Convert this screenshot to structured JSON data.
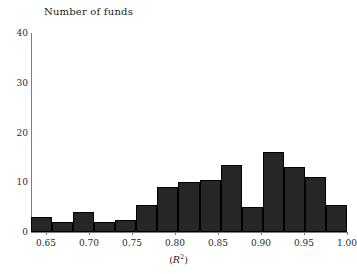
{
  "chart_data": {
    "type": "bar",
    "title": "Number of funds",
    "xlabel": "(R2)",
    "ylabel": "Number of funds",
    "xlim": [
      0.6325,
      1.0
    ],
    "ylim": [
      0,
      40
    ],
    "grid": false,
    "legend": "none",
    "bin_width": 0.0245,
    "x_ticks": [
      "0.65",
      "0.70",
      "0.75",
      "0.80",
      "0.85",
      "0.90",
      "0.95",
      "1.00"
    ],
    "x_tick_values": [
      0.65,
      0.7,
      0.75,
      0.8,
      0.85,
      0.9,
      0.95,
      1.0
    ],
    "y_ticks": [
      "0",
      "10",
      "20",
      "30",
      "40"
    ],
    "y_tick_values": [
      0,
      10,
      20,
      30,
      40
    ],
    "categories": [
      "0.633-0.657",
      "0.657-0.682",
      "0.682-0.706",
      "0.706-0.731",
      "0.731-0.755",
      "0.755-0.780",
      "0.780-0.804",
      "0.804-0.829",
      "0.829-0.853",
      "0.853-0.878",
      "0.878-0.902",
      "0.902-0.927",
      "0.927-0.951",
      "0.951-0.976",
      "0.976-1.000"
    ],
    "bin_left": [
      0.6325,
      0.657,
      0.6815,
      0.706,
      0.7305,
      0.755,
      0.7795,
      0.804,
      0.8285,
      0.853,
      0.8775,
      0.902,
      0.9265,
      0.951,
      0.9755
    ],
    "bin_right": [
      0.657,
      0.6815,
      0.706,
      0.7305,
      0.755,
      0.7795,
      0.804,
      0.8285,
      0.853,
      0.8775,
      0.902,
      0.9265,
      0.951,
      0.9755,
      1.0
    ],
    "values": [
      3,
      2,
      4,
      2,
      2.5,
      5.5,
      9,
      10,
      10.5,
      13.5,
      5,
      16,
      13,
      11,
      5.5
    ],
    "bar_color": "#262626"
  },
  "axis": {
    "title": "Number of funds",
    "x_title_prefix": "(",
    "x_title_var": "R",
    "x_title_exp": "2",
    "x_title_suffix": ")"
  }
}
